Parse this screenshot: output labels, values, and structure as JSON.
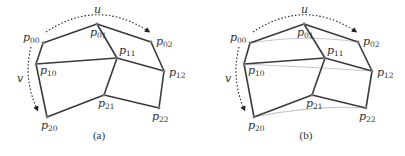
{
  "panels": [
    {
      "id": "a",
      "caption": "(a)",
      "u_label": "u",
      "v_label": "v",
      "points": {
        "p00": {
          "x": 43,
          "y": 43,
          "label": "p",
          "sub": "00"
        },
        "p01": {
          "x": 97,
          "y": 24,
          "label": "p",
          "sub": "01"
        },
        "p02": {
          "x": 151,
          "y": 42,
          "label": "p",
          "sub": "02"
        },
        "p10": {
          "x": 36,
          "y": 64,
          "label": "p",
          "sub": "10"
        },
        "p11": {
          "x": 117,
          "y": 58,
          "label": "p",
          "sub": "11"
        },
        "p12": {
          "x": 164,
          "y": 71,
          "label": "p",
          "sub": "12"
        },
        "p20": {
          "x": 47,
          "y": 117,
          "label": "p",
          "sub": "20"
        },
        "p21": {
          "x": 104,
          "y": 95,
          "label": "p",
          "sub": "21"
        },
        "p22": {
          "x": 159,
          "y": 108,
          "label": "p",
          "sub": "22"
        }
      },
      "show_rest_curves": false
    },
    {
      "id": "b",
      "caption": "(b)",
      "u_label": "u",
      "v_label": "v",
      "points": {
        "p00": {
          "x": 250,
          "y": 43,
          "label": "p",
          "sub": "00"
        },
        "p01": {
          "x": 304,
          "y": 24,
          "label": "p",
          "sub": "01"
        },
        "p02": {
          "x": 358,
          "y": 42,
          "label": "p",
          "sub": "02"
        },
        "p10": {
          "x": 244,
          "y": 64,
          "label": "p",
          "sub": "10"
        },
        "p11": {
          "x": 325,
          "y": 58,
          "label": "p",
          "sub": "11"
        },
        "p12": {
          "x": 372,
          "y": 71,
          "label": "p",
          "sub": "12"
        },
        "p20": {
          "x": 254,
          "y": 117,
          "label": "p",
          "sub": "20"
        },
        "p21": {
          "x": 312,
          "y": 95,
          "label": "p",
          "sub": "21"
        },
        "p22": {
          "x": 366,
          "y": 108,
          "label": "p",
          "sub": "22"
        }
      },
      "show_rest_curves": true
    }
  ],
  "colors": {
    "edge": "#3a3a3a",
    "curve": "#c8c8c8",
    "text": "#333333",
    "point": "#777777"
  }
}
